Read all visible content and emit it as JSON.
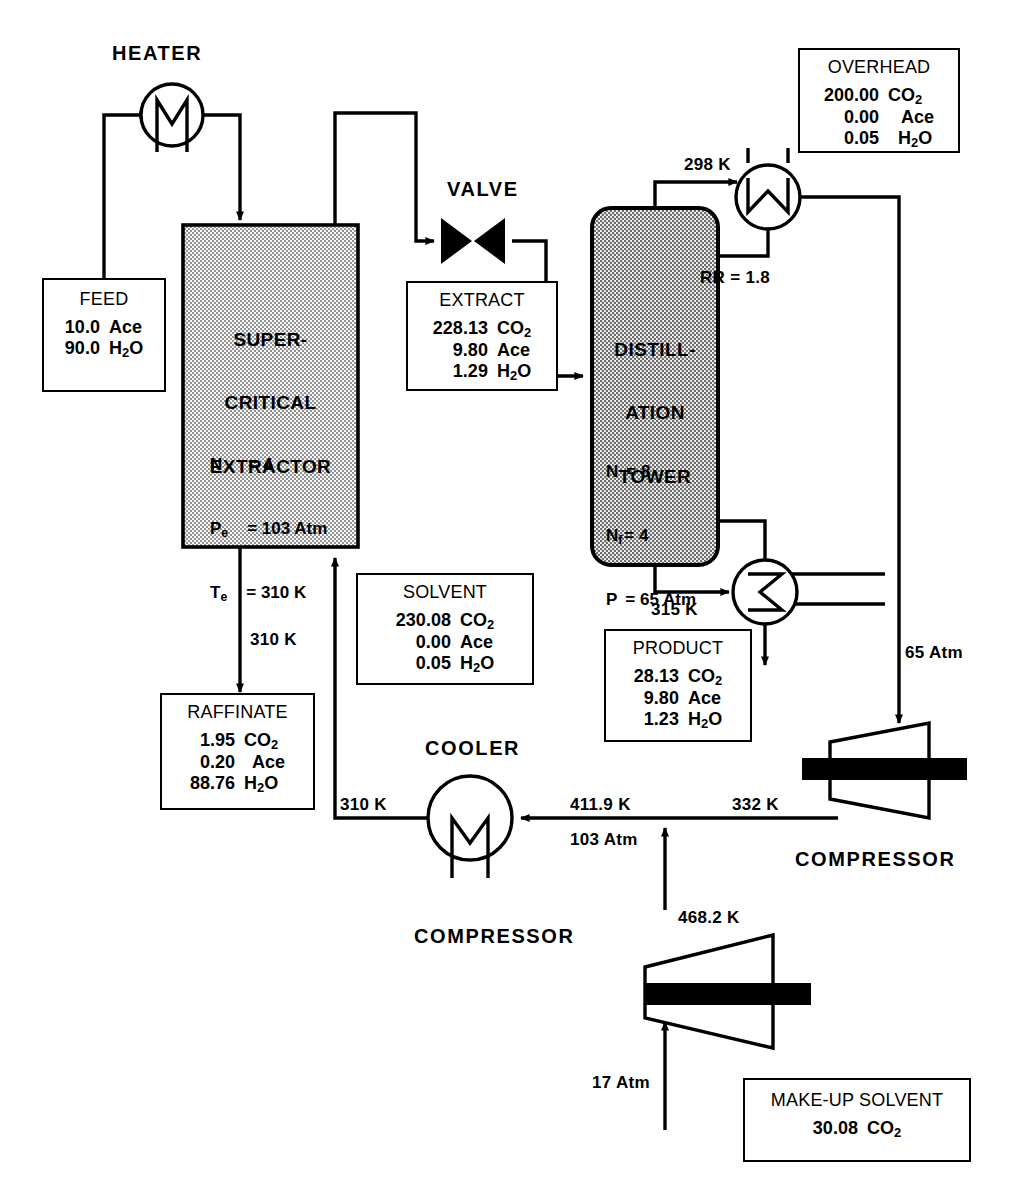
{
  "diagram": {
    "equipment_labels": {
      "heater": "HEATER",
      "valve": "VALVE",
      "cooler": "COOLER",
      "compressor_right": "COMPRESSOR",
      "compressor_bottom": "COMPRESSOR"
    },
    "vessels": {
      "extractor": {
        "name_lines": [
          "SUPER-",
          "CRITICAL",
          "EXTRACTOR"
        ],
        "specs": [
          {
            "sym": "N",
            "sub": "",
            "eq": "=",
            "val": "4"
          },
          {
            "sym": "P",
            "sub": "e",
            "eq": "=",
            "val": "103 Atm"
          },
          {
            "sym": "T",
            "sub": "e",
            "eq": "=",
            "val": "310 K"
          }
        ]
      },
      "tower": {
        "name_lines": [
          "DISTILL-",
          "ATION",
          "TOWER"
        ],
        "specs": [
          {
            "sym": "N",
            "sub": "",
            "eq": "=",
            "val": "8"
          },
          {
            "sym": "N",
            "sub": "f",
            "eq": "=",
            "val": "4"
          },
          {
            "sym": "P",
            "sub": "",
            "eq": "=",
            "val": "65 Atm"
          }
        ]
      }
    },
    "stream_boxes": {
      "feed": {
        "title": "FEED",
        "rows": [
          {
            "value": "10.0",
            "species": "Ace",
            "sub": ""
          },
          {
            "value": "90.0",
            "species": "H",
            "sub": "2",
            "species_tail": "O"
          }
        ]
      },
      "extract": {
        "title": "EXTRACT",
        "rows": [
          {
            "value": "228.13",
            "species": "CO",
            "sub": "2",
            "species_tail": ""
          },
          {
            "value": "9.80",
            "species": "Ace",
            "sub": "",
            "species_tail": ""
          },
          {
            "value": "1.29",
            "species": "H",
            "sub": "2",
            "species_tail": "O"
          }
        ]
      },
      "overhead": {
        "title": "OVERHEAD",
        "rows": [
          {
            "value": "200.00",
            "species": "CO",
            "sub": "2",
            "species_tail": ""
          },
          {
            "value": "0.00",
            "species": "Ace",
            "sub": "",
            "species_tail": ""
          },
          {
            "value": "0.05",
            "species": "H",
            "sub": "2",
            "species_tail": "O"
          }
        ]
      },
      "solvent": {
        "title": "SOLVENT",
        "rows": [
          {
            "value": "230.08",
            "species": "CO",
            "sub": "2",
            "species_tail": ""
          },
          {
            "value": "0.00",
            "species": "Ace",
            "sub": "",
            "species_tail": ""
          },
          {
            "value": "0.05",
            "species": "H",
            "sub": "2",
            "species_tail": "O"
          }
        ]
      },
      "raffinate": {
        "title": "RAFFINATE",
        "rows": [
          {
            "value": "1.95",
            "species": "CO",
            "sub": "2",
            "species_tail": ""
          },
          {
            "value": "0.20",
            "species": "Ace",
            "sub": "",
            "species_tail": ""
          },
          {
            "value": "88.76",
            "species": "H",
            "sub": "2",
            "species_tail": "O"
          }
        ]
      },
      "product": {
        "title": "PRODUCT",
        "rows": [
          {
            "value": "28.13",
            "species": "CO",
            "sub": "2",
            "species_tail": ""
          },
          {
            "value": "9.80",
            "species": "Ace",
            "sub": "",
            "species_tail": ""
          },
          {
            "value": "1.23",
            "species": "H",
            "sub": "2",
            "species_tail": "O"
          }
        ]
      },
      "makeup_solvent": {
        "title": "MAKE-UP SOLVENT",
        "rows": [
          {
            "value": "30.08",
            "species": "CO",
            "sub": "2",
            "species_tail": ""
          }
        ]
      }
    },
    "stream_labels": {
      "condenser_feed_temp": "298 K",
      "reflux_ratio": "RR = 1.8",
      "raffinate_temp": "310 K",
      "reboiler_feed_temp": "315 K",
      "cooler_out_temp": "310 K",
      "cooler_in_temp": "411.9 K",
      "cooler_in_press": "103 Atm",
      "turbine_in_temp": "332 K",
      "tower_overhead_press": "65 Atm",
      "compressor_out_temp": "468.2 K",
      "makeup_press": "17 Atm"
    },
    "colors": {
      "line": "#000000",
      "vessel_fill": "#b4b4b4",
      "extractor_fill": "#d8d8d8",
      "background": "#ffffff"
    }
  }
}
